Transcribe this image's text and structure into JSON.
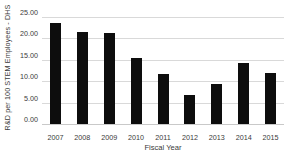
{
  "chart_data": {
    "type": "bar",
    "title": "",
    "xlabel": "Fiscal Year",
    "ylabel": "R&D per 100 STEM Employees - DHS",
    "categories": [
      "2007",
      "2008",
      "2009",
      "2010",
      "2011",
      "2012",
      "2013",
      "2014",
      "2015"
    ],
    "values": [
      23.5,
      21.5,
      21.25,
      15.5,
      11.8,
      6.7,
      9.4,
      14.2,
      12.0
    ],
    "ylim": [
      0,
      25
    ],
    "ytick_values": [
      0,
      5,
      10,
      15,
      20,
      25
    ],
    "ytick_labels": [
      "0.00",
      "5.00",
      "10.00",
      "15.00",
      "20.00",
      "25.00"
    ],
    "grid": true,
    "legend": false,
    "bar_color": "#0d0d0d",
    "gridline_color": "#d9d9d9",
    "text_color": "#3a3a3a",
    "background_color": "#ffffff"
  }
}
